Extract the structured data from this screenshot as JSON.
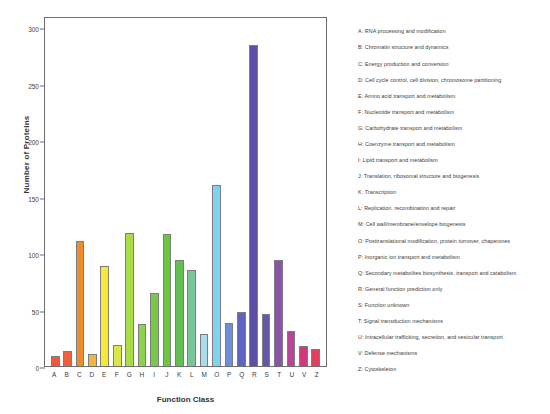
{
  "chart_data": {
    "type": "bar",
    "title": "",
    "xlabel": "Function Class",
    "ylabel": "Number of Proteins",
    "ylim": [
      0,
      310
    ],
    "yticks": [
      0,
      50,
      100,
      150,
      200,
      250,
      300
    ],
    "ytick_labels": [
      "0",
      "50",
      "100",
      "150",
      "200",
      "250",
      "300"
    ],
    "grid": false,
    "legend_position": "right",
    "categories": [
      "A",
      "B",
      "C",
      "D",
      "E",
      "F",
      "G",
      "H",
      "I",
      "J",
      "K",
      "L",
      "M",
      "O",
      "P",
      "Q",
      "R",
      "S",
      "T",
      "U",
      "V",
      "Z"
    ],
    "values": [
      9,
      13,
      111,
      11,
      89,
      19,
      118,
      37,
      65,
      117,
      94,
      85,
      28,
      160,
      38,
      48,
      284,
      46,
      94,
      31,
      18,
      15
    ],
    "bar_colors": [
      "#ef5a3a",
      "#f0603a",
      "#ef8c2a",
      "#f2b53c",
      "#f6ea35",
      "#dbe64a",
      "#a8dd4a",
      "#8ed24a",
      "#78c947",
      "#6cc644",
      "#62bf52",
      "#78c79a",
      "#a9dced",
      "#7fd2f0",
      "#6f8fd8",
      "#5f63c4",
      "#5b4fa8",
      "#6657ad",
      "#8c53ad",
      "#b8459a",
      "#d0397e",
      "#e0405e"
    ]
  },
  "legend": {
    "items": [
      "A: RNA processing and modification",
      "B: Chromatin structure and dynamics",
      "C: Energy production and conversion",
      "D: Cell cycle control, cell division, chromosome partitioning",
      "E: Amino acid transport and metabolism",
      "F: Nucleotide transport and metabolism",
      "G: Carbohydrate transport and metabolism",
      "H: Coenzyme transport and metabolism",
      "I: Lipid transport and metabolism",
      "J: Translation, ribosomal structure and biogenesis",
      "K: Transcription",
      "L: Replication, recombination and repair",
      "M: Cell wall/membrane/envelope biogenesis",
      "O: Posttranslational modification, protein turnover, chaperones",
      "P: Inorganic ion transport and metabolism",
      "Q: Secondary metabolites biosynthesis, transport and catabolism",
      "R: General function prediction only",
      "S: Function unknown",
      "T: Signal transduction mechanisms",
      "U: Intracellular trafficking, secretion, and vesicular transport",
      "V: Defense mechanisms",
      "Z: Cytoskeleton"
    ]
  }
}
